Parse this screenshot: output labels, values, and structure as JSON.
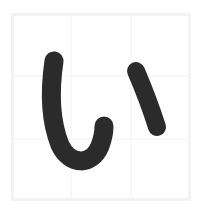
{
  "canvas": {
    "width": 204,
    "height": 215,
    "background_color": "#ffffff"
  },
  "practice_box": {
    "label": "character practice square",
    "x": 11,
    "y": 13,
    "width": 180,
    "height": 188,
    "border_color": "#f3f3f3",
    "border_width": 3,
    "fill_color": "#ffffff"
  },
  "grid": {
    "label": "thirds guide grid",
    "visible": true,
    "line_color": "#f2f2f2",
    "line_width": 1,
    "vertical_lines_x": [
      71,
      131
    ],
    "horizontal_lines_y": [
      76,
      139
    ]
  },
  "character": {
    "glyph": "い",
    "romaji": "i",
    "script": "hiragana",
    "ink_color": "#2b2b2b",
    "stroke_count": 2,
    "strokes": [
      {
        "index": 1,
        "name": "left-curve-stroke",
        "description": "long vertical curve descending then hooking up to the right",
        "width": 19,
        "path": "M 54 61 C 50 88, 50 120, 60 145 C 70 166, 92 166, 100 146 C 103 138, 104 131, 104 126"
      },
      {
        "index": 2,
        "name": "right-short-stroke",
        "description": "short curve slanting down to the right",
        "width": 18,
        "path": "M 136 71 C 142 85, 150 105, 157 127"
      }
    ]
  }
}
